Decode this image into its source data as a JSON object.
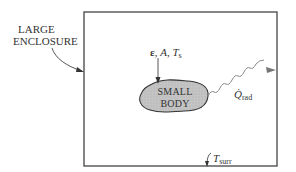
{
  "diagram": {
    "enclosure_label_line1": "LARGE",
    "enclosure_label_line2": "ENCLOSURE",
    "body_label_line1": "SMALL",
    "body_label_line2": "BODY",
    "body_properties": {
      "emissivity": "ε",
      "area": "A",
      "temperature_symbol": "T",
      "temperature_subscript": "s"
    },
    "radiation": {
      "symbol": "Q̇",
      "subscript": "rad"
    },
    "surroundings": {
      "symbol": "T",
      "subscript": "surr"
    },
    "colors": {
      "line": "#444444",
      "body_fill": "#c8c8c8",
      "arrow": "#777777"
    }
  }
}
